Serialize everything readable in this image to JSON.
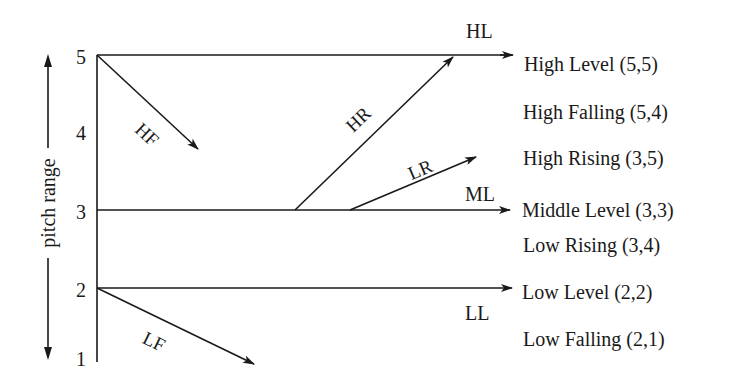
{
  "axis": {
    "label": "pitch range",
    "ticks": [
      "5",
      "4",
      "3",
      "2",
      "1"
    ]
  },
  "line_labels": {
    "HL": "HL",
    "HF": "HF",
    "HR": "HR",
    "LR": "LR",
    "ML": "ML",
    "LF": "LF",
    "LL": "LL"
  },
  "legend": [
    {
      "label": "High Level (5,5)"
    },
    {
      "label": "High Falling (5,4)"
    },
    {
      "label": "High Rising (3,5)"
    },
    {
      "label": "Middle Level (3,3)"
    },
    {
      "label": "Low Rising (3,4)"
    },
    {
      "label": "Low Level (2,2)"
    },
    {
      "label": "Low Falling (2,1)"
    }
  ],
  "colors": {
    "ink": "#1a1a1a",
    "background": "#ffffff"
  }
}
